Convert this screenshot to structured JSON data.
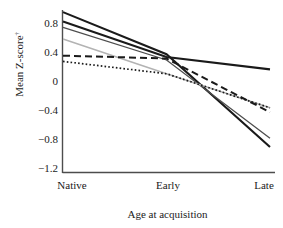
{
  "chart_data": {
    "type": "line",
    "title": "",
    "xlabel": "Age at acquisition",
    "ylabel": "Mean Z-score†",
    "ylabel_text": "Mean Z-score",
    "ylabel_superscript": "†",
    "categories": [
      "Native",
      "Early",
      "Late"
    ],
    "x_tick_labels": [
      "Native",
      "Early",
      "Late"
    ],
    "y_tick_labels": [
      "0.8",
      "0.4",
      "0",
      "−0.4",
      "−0.8",
      "−1.2"
    ],
    "y_tick_values": [
      0.8,
      0.4,
      0,
      -0.4,
      -0.8,
      -1.2
    ],
    "ylim": [
      -1.2,
      1.0
    ],
    "xlim": [
      0,
      2
    ],
    "grid": false,
    "legend": "none",
    "legend_position": "none",
    "series": [
      {
        "name": "series-1",
        "style": "solid",
        "color": "#1a1a1a",
        "width": 2.1,
        "values": [
          0.95,
          0.37,
          -0.91
        ]
      },
      {
        "name": "series-2",
        "style": "solid",
        "color": "#1a1a1a",
        "width": 2.1,
        "values": [
          0.82,
          0.33,
          0.16
        ]
      },
      {
        "name": "series-3",
        "style": "solid",
        "color": "#4d4d4d",
        "width": 1.3,
        "values": [
          0.74,
          0.29,
          -0.79
        ]
      },
      {
        "name": "series-4",
        "style": "solid",
        "color": "#b3b3b3",
        "width": 1.5,
        "values": [
          0.58,
          0.1,
          -0.37
        ]
      },
      {
        "name": "series-5",
        "style": "dashed",
        "color": "#1a1a1a",
        "width": 2.0,
        "values": [
          0.35,
          0.31,
          -0.43
        ]
      },
      {
        "name": "series-6",
        "style": "dotted",
        "color": "#1a1a1a",
        "width": 1.7,
        "values": [
          0.27,
          0.1,
          -0.37
        ]
      }
    ]
  },
  "axes": {
    "y_axis_color": "#4d4d4d",
    "x_axis_color": "#4d4d4d",
    "background": "#ffffff"
  }
}
